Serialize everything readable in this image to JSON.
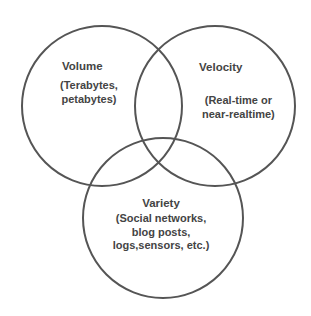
{
  "diagram": {
    "type": "venn",
    "stroke_color": "#555555",
    "text_color": "#444444",
    "background": "#ffffff",
    "sets": [
      {
        "id": "volume",
        "title": "Volume",
        "description_lines": [
          "(Terabytes,",
          "petabytes)"
        ],
        "position": "top-left"
      },
      {
        "id": "velocity",
        "title": "Velocity",
        "description_lines": [
          "(Real-time or",
          "near-realtime)"
        ],
        "position": "top-right"
      },
      {
        "id": "variety",
        "title": "Variety",
        "description_lines": [
          "(Social networks,",
          "blog posts,",
          "logs,sensors, etc.)"
        ],
        "position": "bottom"
      }
    ]
  }
}
